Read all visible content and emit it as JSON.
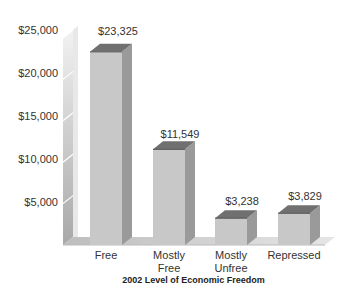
{
  "chart_data": {
    "type": "bar",
    "title": "",
    "xlabel": "2002 Level of Economic Freedom",
    "ylabel": "",
    "categories": [
      "Free",
      "Mostly Free",
      "Mostly Unfree",
      "Repressed"
    ],
    "category_lines": [
      [
        "Free"
      ],
      [
        "Mostly",
        "Free"
      ],
      [
        "Mostly",
        "Unfree"
      ],
      [
        "Repressed"
      ]
    ],
    "values": [
      23325,
      11549,
      3238,
      3829
    ],
    "value_labels": [
      "$23,325",
      "$11,549",
      "$3,238",
      "$3,829"
    ],
    "ylim": [
      0,
      25000
    ],
    "yticks": [
      5000,
      10000,
      15000,
      20000,
      25000
    ],
    "ytick_labels": [
      "$5,000",
      "$10,000",
      "$15,000",
      "$20,000",
      "$25,000"
    ],
    "grid": false,
    "legend": null,
    "style": "3d-bar",
    "colors": {
      "bar_front": "#c8c8c8",
      "bar_side": "#9a9a9a",
      "bar_top": "#707070",
      "wall": "#bdbdbd",
      "floor": "#d4d4d4"
    }
  }
}
